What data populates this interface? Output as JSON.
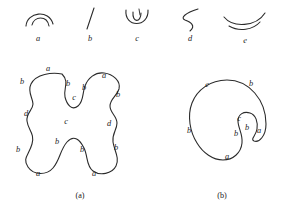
{
  "figure": {
    "background_color": "#ffffff",
    "ink_color": "#2b2b2b",
    "primitives": {
      "title": "",
      "items": [
        {
          "id": "a",
          "label": "a",
          "shape": "double-arc-cap",
          "label_x": 38,
          "label_y": 41
        },
        {
          "id": "b",
          "label": "b",
          "shape": "slanted-straight-line",
          "label_x": 90,
          "label_y": 41
        },
        {
          "id": "c",
          "label": "c",
          "shape": "u-cup-with-inner-tick",
          "label_x": 137,
          "label_y": 41
        },
        {
          "id": "d",
          "label": "d",
          "shape": "s-curve",
          "label_x": 190,
          "label_y": 41
        },
        {
          "id": "e",
          "label": "e",
          "shape": "shallow-double-smile",
          "label_x": 245,
          "label_y": 43
        }
      ]
    },
    "panel_a": {
      "caption": "(a)",
      "caption_x": 80,
      "caption_y": 198,
      "description": "four-lobed closed curve",
      "labels": [
        {
          "text": "a",
          "x": 48,
          "y": 71
        },
        {
          "text": "b",
          "x": 22,
          "y": 84
        },
        {
          "text": "b",
          "x": 68,
          "y": 86
        },
        {
          "text": "b",
          "x": 84,
          "y": 90
        },
        {
          "text": "c",
          "x": 74,
          "y": 100
        },
        {
          "text": "a",
          "x": 104,
          "y": 78
        },
        {
          "text": "b",
          "x": 118,
          "y": 97
        },
        {
          "text": "d",
          "x": 26,
          "y": 116
        },
        {
          "text": "d",
          "x": 109,
          "y": 126
        },
        {
          "text": "c",
          "x": 66,
          "y": 124
        },
        {
          "text": "b",
          "x": 57,
          "y": 144
        },
        {
          "text": "b",
          "x": 18,
          "y": 152
        },
        {
          "text": "b",
          "x": 82,
          "y": 152
        },
        {
          "text": "b",
          "x": 116,
          "y": 150
        },
        {
          "text": "a",
          "x": 38,
          "y": 176
        },
        {
          "text": "a",
          "x": 94,
          "y": 176
        }
      ]
    },
    "panel_b": {
      "caption": "(b)",
      "caption_x": 222,
      "caption_y": 198,
      "description": "hook-shaped closed spiral curve",
      "labels": [
        {
          "text": "e",
          "x": 207,
          "y": 87
        },
        {
          "text": "b",
          "x": 251,
          "y": 86
        },
        {
          "text": "b",
          "x": 189,
          "y": 133
        },
        {
          "text": "c",
          "x": 239,
          "y": 121
        },
        {
          "text": "b",
          "x": 247,
          "y": 130
        },
        {
          "text": "b",
          "x": 236,
          "y": 136
        },
        {
          "text": "a",
          "x": 259,
          "y": 133
        },
        {
          "text": "a",
          "x": 227,
          "y": 159
        }
      ]
    }
  }
}
